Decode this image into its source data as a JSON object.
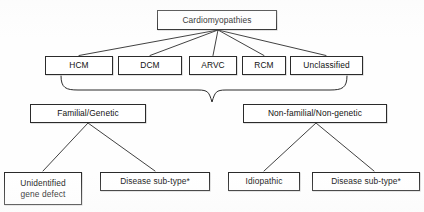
{
  "figure": {
    "line_color": "#2b2b2b",
    "box_fill": "#ffffff",
    "text_color": "#111111"
  },
  "nodes": {
    "root": {
      "label": "Cardiomyopathies"
    },
    "types": [
      {
        "label": "HCM"
      },
      {
        "label": "DCM"
      },
      {
        "label": "ARVC"
      },
      {
        "label": "RCM"
      },
      {
        "label": "Unclassified"
      }
    ],
    "groups": [
      {
        "label": "Familial/Genetic"
      },
      {
        "label": "Non-familial/Non-genetic"
      }
    ],
    "leaves": [
      {
        "label": "Unidentified\ngene defect"
      },
      {
        "label": "Disease sub-type*"
      },
      {
        "label": "Idiopathic"
      },
      {
        "label": "Disease sub-type*"
      }
    ]
  }
}
